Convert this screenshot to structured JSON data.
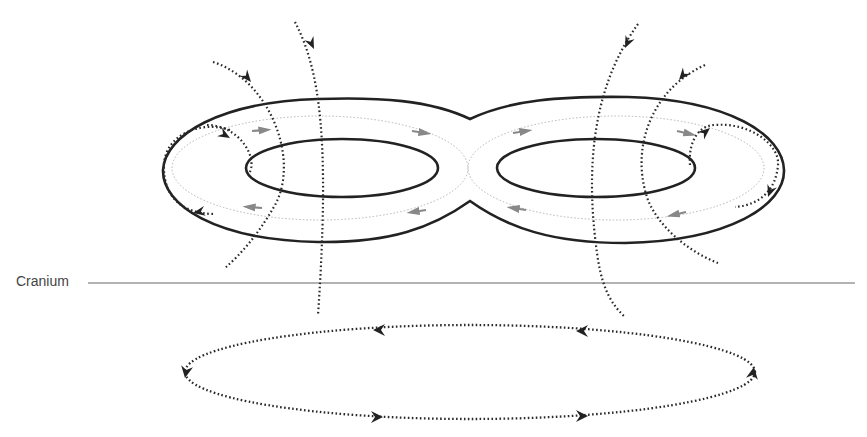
{
  "diagram": {
    "labels": {
      "cranium": "Cranium"
    },
    "elements": {
      "coil": "figure-8 coil (two wings)",
      "coil_current": "induced coil current direction (dotted loops with arrows)",
      "field_lines": "magnetic field lines passing through coil",
      "cranium_line": "cranium boundary",
      "induced_current": "induced electric current loop in tissue"
    },
    "colors": {
      "coil": "#222222",
      "field_line": "#2a2a2a",
      "coil_current": "#aaaaaa",
      "cranium": "#999999",
      "text": "#444444"
    }
  }
}
